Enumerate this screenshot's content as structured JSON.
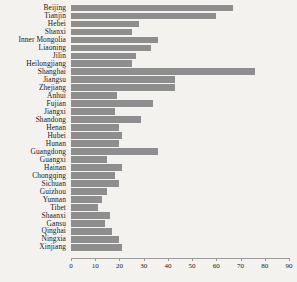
{
  "chart_data": {
    "type": "bar",
    "orientation": "horizontal",
    "title": "",
    "subtitle": "",
    "xlabel": "",
    "ylabel": "",
    "xlim": [
      0,
      90
    ],
    "ylim": null,
    "grid": false,
    "legend": null,
    "bar_color": "#8e8e8e",
    "background_color": "#f3f2ee",
    "xticks": [
      0,
      10,
      20,
      30,
      40,
      50,
      60,
      70,
      80,
      90
    ],
    "xtick_labels": [
      "0",
      "10",
      "20",
      "30",
      "40",
      "50",
      "60",
      "70",
      "80",
      "90"
    ],
    "categories": [
      "Beijing",
      "Tianjin",
      "Hebei",
      "Shanxi",
      "Inner Mongolia",
      "Liaoning",
      "Jilin",
      "Heilongjiang",
      "Shanghai",
      "Jiangsu",
      "Zhejiang",
      "Anhui",
      "Fujian",
      "Jiangxi",
      "Shandong",
      "Henan",
      "Hubei",
      "Hunan",
      "Guangdong",
      "Guangxi",
      "Hainan",
      "Chongqing",
      "Sichuan",
      "Guizhou",
      "Yunnan",
      "Tibet",
      "Shaanxi",
      "Gansu",
      "Qinghai",
      "Ningxia",
      "Xinjiang"
    ],
    "values": [
      67,
      60,
      28,
      25,
      36,
      33,
      27,
      25,
      76,
      43,
      43,
      19,
      34,
      18,
      29,
      20,
      21,
      20,
      36,
      15,
      21,
      18,
      20,
      15,
      13,
      11,
      16,
      14,
      17,
      20,
      21
    ]
  }
}
